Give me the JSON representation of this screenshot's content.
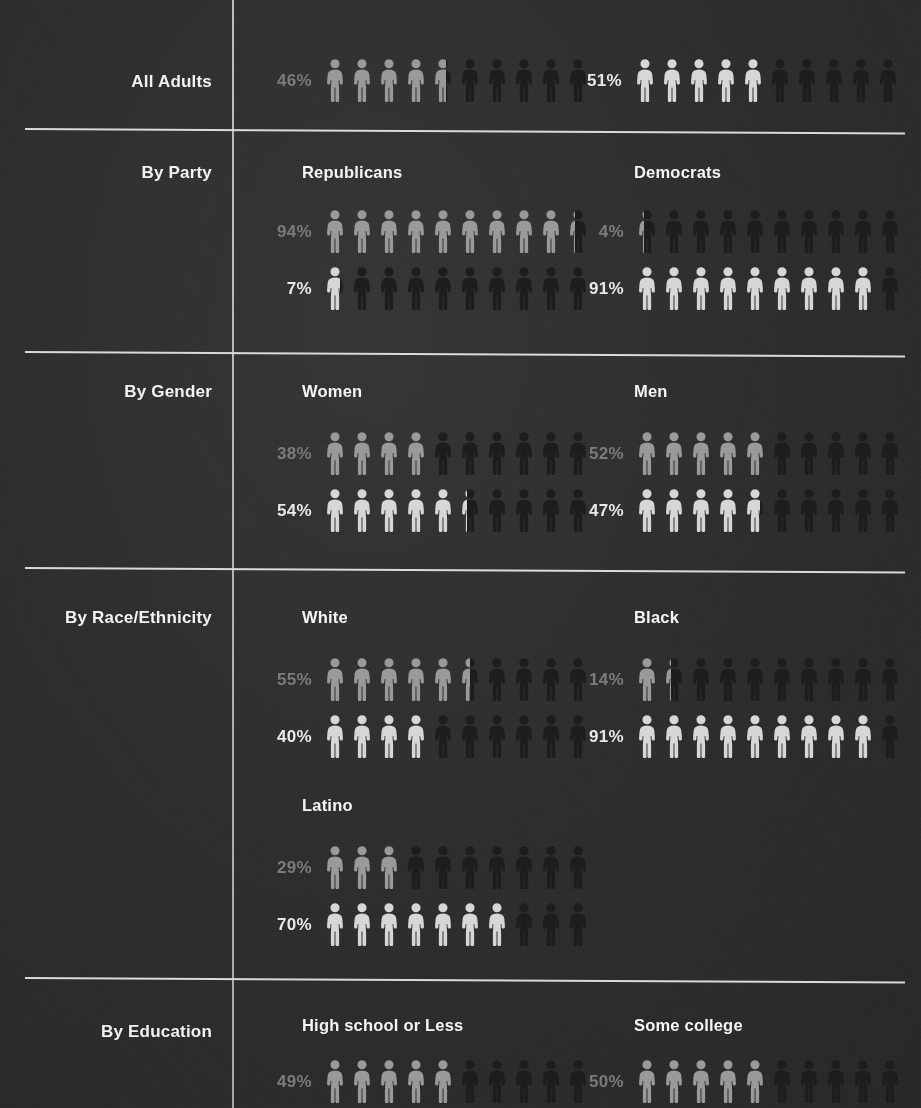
{
  "theme": {
    "background": "#2e2e2e",
    "rule_color": "#e9e9e9",
    "label_color": "#f2f2f2",
    "dim_figure_color": "#9a9a9a",
    "bright_figure_color": "#d7d7d7",
    "empty_figure_color": "#1d1d1d",
    "dim_percent_color": "#7c7c7c",
    "bright_percent_color": "#e9e9e9"
  },
  "chart_data": {
    "type": "bar",
    "subtype": "pictogram-isotype",
    "title": "",
    "xlabel": "",
    "ylabel": "",
    "units": "percent",
    "icons_per_row": 10,
    "icon_value": 10,
    "value_range": [
      0,
      100
    ],
    "series": [
      {
        "name": "series-a",
        "style": "dim",
        "color": "#9a9a9a"
      },
      {
        "name": "series-b",
        "style": "bright",
        "color": "#d7d7d7"
      }
    ],
    "sections": [
      {
        "id": "all-adults",
        "label": "All Adults",
        "inline": true,
        "groups": [
          {
            "id": "all-adults-a",
            "title": "",
            "rows": [
              {
                "series": "series-a",
                "value": 46,
                "label": "46%",
                "style": "dim"
              }
            ]
          },
          {
            "id": "all-adults-b",
            "title": "",
            "rows": [
              {
                "series": "series-b",
                "value": 51,
                "label": "51%",
                "style": "bright"
              }
            ]
          }
        ]
      },
      {
        "id": "by-party",
        "label": "By Party",
        "groups": [
          {
            "id": "republicans",
            "title": "Republicans",
            "rows": [
              {
                "series": "series-a",
                "value": 94,
                "label": "94%",
                "style": "dim"
              },
              {
                "series": "series-b",
                "value": 7,
                "label": "7%",
                "style": "bright"
              }
            ]
          },
          {
            "id": "democrats",
            "title": "Democrats",
            "rows": [
              {
                "series": "series-a",
                "value": 4,
                "label": "4%",
                "style": "dim"
              },
              {
                "series": "series-b",
                "value": 91,
                "label": "91%",
                "style": "bright"
              }
            ]
          }
        ]
      },
      {
        "id": "by-gender",
        "label": "By Gender",
        "groups": [
          {
            "id": "women",
            "title": "Women",
            "rows": [
              {
                "series": "series-a",
                "value": 38,
                "label": "38%",
                "style": "dim"
              },
              {
                "series": "series-b",
                "value": 54,
                "label": "54%",
                "style": "bright"
              }
            ]
          },
          {
            "id": "men",
            "title": "Men",
            "rows": [
              {
                "series": "series-a",
                "value": 52,
                "label": "52%",
                "style": "dim"
              },
              {
                "series": "series-b",
                "value": 47,
                "label": "47%",
                "style": "bright"
              }
            ]
          }
        ]
      },
      {
        "id": "by-race-ethnicity",
        "label": "By Race/Ethnicity",
        "groups": [
          {
            "id": "white",
            "title": "White",
            "rows": [
              {
                "series": "series-a",
                "value": 55,
                "label": "55%",
                "style": "dim"
              },
              {
                "series": "series-b",
                "value": 40,
                "label": "40%",
                "style": "bright"
              }
            ]
          },
          {
            "id": "black",
            "title": "Black",
            "rows": [
              {
                "series": "series-a",
                "value": 14,
                "label": "14%",
                "style": "dim"
              },
              {
                "series": "series-b",
                "value": 91,
                "label": "91%",
                "style": "bright"
              }
            ]
          },
          {
            "id": "latino",
            "title": "Latino",
            "rows": [
              {
                "series": "series-a",
                "value": 29,
                "label": "29%",
                "style": "dim"
              },
              {
                "series": "series-b",
                "value": 70,
                "label": "70%",
                "style": "bright"
              }
            ]
          }
        ]
      },
      {
        "id": "by-education",
        "label": "By Education",
        "truncated": true,
        "groups": [
          {
            "id": "high-school-or-less",
            "title": "High school or Less",
            "rows": [
              {
                "series": "series-a",
                "value": 49,
                "label": "49%",
                "style": "dim"
              }
            ]
          },
          {
            "id": "some-college",
            "title": "Some college",
            "rows": [
              {
                "series": "series-a",
                "value": 50,
                "label": "50%",
                "style": "dim"
              }
            ]
          }
        ]
      }
    ]
  }
}
